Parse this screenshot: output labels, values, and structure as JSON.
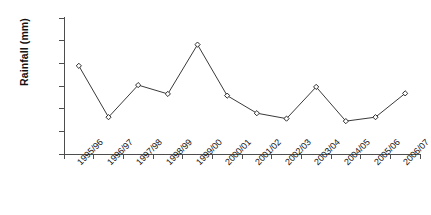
{
  "chart_data": {
    "type": "line",
    "title": "",
    "xlabel": "",
    "ylabel": "Rainfall (mm)",
    "ylim": [
      0,
      1200
    ],
    "ytick_step": 200,
    "yticks": [
      0,
      200,
      400,
      600,
      800,
      1000,
      1200
    ],
    "ytick_labels": [
      "0",
      "200",
      "400",
      "600",
      "800",
      "1000",
      "1200"
    ],
    "grid": false,
    "legend": false,
    "legend_position": "none",
    "marker": "open-diamond",
    "line_color": "#3a3a3a",
    "marker_fill": "#ffffff",
    "marker_edge": "#2b2b2b",
    "axis_color": "#4d4d4d",
    "categories": [
      "1995/96",
      "1996/97",
      "1997/98",
      "1998/99",
      "1999/00",
      "2000/01",
      "2001/02",
      "2002/03",
      "2003/04",
      "2004/05",
      "2005/06",
      "2006/07"
    ],
    "values": [
      778,
      325,
      608,
      530,
      965,
      515,
      360,
      312,
      592,
      290,
      325,
      535
    ],
    "series": [
      {
        "name": "Rainfall",
        "values": [
          778,
          325,
          608,
          530,
          965,
          515,
          360,
          312,
          592,
          290,
          325,
          535
        ]
      }
    ]
  }
}
